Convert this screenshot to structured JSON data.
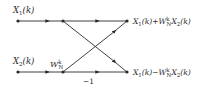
{
  "diagram": {
    "type": "butterfly-flow-graph",
    "inputs": {
      "top": {
        "base": "X",
        "sub": "1",
        "arg": "(k)"
      },
      "bottom": {
        "base": "X",
        "sub": "2",
        "arg": "(k)"
      }
    },
    "twiddle": {
      "base": "W",
      "sup": "k",
      "sub": "N"
    },
    "branch_gain": "−1",
    "outputs": {
      "top": {
        "text_a": "X",
        "sub_a": "1",
        "arg_a": "(k)+",
        "w": "W",
        "w_sup": "k",
        "w_sub": "N",
        "text_b": "X",
        "sub_b": "2",
        "arg_b": "(k)"
      },
      "bottom": {
        "text_a": "X",
        "sub_a": "1",
        "arg_a": "(k)−",
        "w": "W",
        "w_sup": "k",
        "w_sub": "N",
        "text_b": "X",
        "sub_b": "2",
        "arg_b": "(k)"
      }
    },
    "colors": {
      "line": "#2a2a2a",
      "background": "#ffffff"
    }
  }
}
